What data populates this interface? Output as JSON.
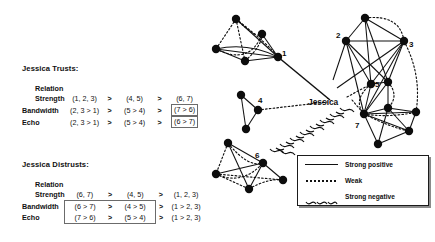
{
  "figure": {
    "legend": {
      "items": [
        {
          "style": "solid",
          "label": "Strong positive"
        },
        {
          "style": "dotted",
          "label": "Weak"
        },
        {
          "style": "wavy",
          "label": "Strong negative"
        }
      ]
    },
    "graph": {
      "hub_label": "Jessica",
      "cluster_labels": [
        "1",
        "2",
        "3",
        "4",
        "5",
        "6",
        "7"
      ]
    }
  },
  "trusts": {
    "title": "Jessica Trusts:",
    "relation_header": "Relation",
    "rows": [
      {
        "label": "Strength",
        "cells": [
          "(1, 2, 3)",
          "(4, 5)",
          "(6, 7)"
        ],
        "separators": [
          ">",
          ">"
        ],
        "boxed": [
          false,
          false,
          false
        ]
      },
      {
        "label": "Bandwidth",
        "cells": [
          "(2, 3 > 1)",
          "(5 > 4)",
          "(7 > 6)"
        ],
        "separators": [
          ">",
          ">"
        ],
        "boxed": [
          false,
          false,
          true
        ]
      },
      {
        "label": "Echo",
        "cells": [
          "(2, 3 > 1)",
          "(5 > 4)",
          "(6 > 7)"
        ],
        "separators": [
          ">",
          ">"
        ],
        "boxed": [
          false,
          false,
          true
        ]
      }
    ]
  },
  "distrusts": {
    "title": "Jessica Distrusts:",
    "relation_header": "Relation",
    "rows": [
      {
        "label": "Strength",
        "cells": [
          "(6, 7)",
          "(4, 5)",
          "(1, 2, 3)"
        ],
        "separators": [
          ">",
          ">"
        ],
        "boxed": [
          false,
          false,
          false
        ]
      },
      {
        "label": "Bandwidth",
        "cells": [
          "(6 > 7)",
          "(4 > 5)",
          "(1 > 2, 3)"
        ],
        "separators": [
          ">",
          ">"
        ],
        "boxed": [
          true,
          true,
          false
        ]
      },
      {
        "label": "Echo",
        "cells": [
          "(7 > 6)",
          "(5 > 4)",
          "(1 > 2, 3)"
        ],
        "separators": [
          ">",
          ">"
        ],
        "boxed": [
          true,
          true,
          false
        ]
      }
    ]
  }
}
